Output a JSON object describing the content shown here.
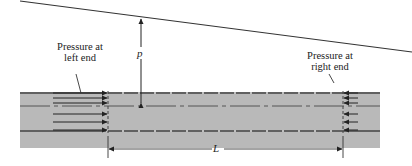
{
  "diagram": {
    "labels": {
      "left_pressure_line1": "Pressure at",
      "left_pressure_line2": "left end",
      "right_pressure_line1": "Pressure at",
      "right_pressure_line2": "right end",
      "pressure_symbol": "p",
      "length_symbol": "L"
    },
    "colors": {
      "pipe_fill": "#b9b9b9",
      "line": "#333333",
      "background": "#ffffff"
    },
    "arrows": {
      "left_end_count": 6,
      "left_end_direction": "right",
      "right_end_count": 6,
      "right_end_direction": "left"
    }
  }
}
